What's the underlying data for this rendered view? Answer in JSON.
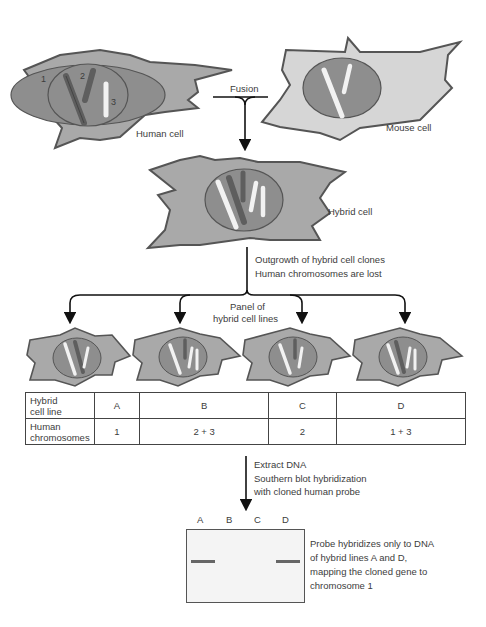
{
  "diagram": {
    "cells": {
      "human": {
        "label": "Human cell",
        "chromosome_labels": [
          "1",
          "2",
          "3"
        ]
      },
      "mouse": {
        "label": "Mouse cell"
      },
      "hybrid": {
        "label": "Hybrid cell"
      }
    },
    "steps": {
      "fusion": "Fusion",
      "outgrowth_line1": "Outgrowth of hybrid cell clones",
      "outgrowth_line2": "Human chromosomes are lost",
      "panel_line1": "Panel of",
      "panel_line2": "hybrid cell lines",
      "extract_line1": "Extract DNA",
      "extract_line2": "Southern blot hybridization",
      "extract_line3": "with cloned human probe"
    },
    "table": {
      "row1_header_line1": "Hybrid",
      "row1_header_line2": "cell line",
      "row2_header_line1": "Human",
      "row2_header_line2": "chromosomes",
      "columns": [
        {
          "line": "A",
          "chromosomes": "1"
        },
        {
          "line": "B",
          "chromosomes": "2 + 3"
        },
        {
          "line": "C",
          "chromosomes": "2"
        },
        {
          "line": "D",
          "chromosomes": "1 + 3"
        }
      ]
    },
    "blot": {
      "lanes": [
        "A",
        "B",
        "C",
        "D"
      ],
      "bands_present": [
        true,
        false,
        false,
        true
      ],
      "caption_line1": "Probe hybridizes only to DNA",
      "caption_line2": "of hybrid lines A and D,",
      "caption_line3": "mapping the cloned gene to",
      "caption_line4": "chromosome 1"
    },
    "colors": {
      "cytoplasm_human": "#a9a9a9",
      "cytoplasm_mouse": "#d6d6d6",
      "nucleus": "#8e8e8e",
      "outline": "#555555",
      "chromosome_dark": "#5e5e5e",
      "chromosome_light": "#f2f2f2",
      "band": "#666666"
    }
  }
}
